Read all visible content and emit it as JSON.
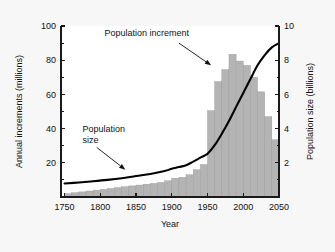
{
  "chart_data": {
    "type": "bar",
    "title": "",
    "xlabel": "Year",
    "ylabel": "Annual increments (millions)",
    "y2label": "Population size (billions)",
    "xlim": [
      1745,
      2050
    ],
    "ylim": [
      0,
      100
    ],
    "y2lim": [
      0,
      10
    ],
    "grid": false,
    "legend_position": "none",
    "x_ticks": [
      1750,
      1800,
      1850,
      1900,
      1950,
      2000,
      2050
    ],
    "x_tick_labels": [
      "1750",
      "1800",
      "1850",
      "1900",
      "1950",
      "2000",
      "2050"
    ],
    "y_ticks": [
      0,
      20,
      40,
      60,
      80,
      100
    ],
    "y_tick_labels": [
      "",
      "20",
      "40",
      "60",
      "80",
      "100"
    ],
    "y_minor_ticks": [
      10,
      30,
      50,
      70,
      90
    ],
    "y2_ticks": [
      2,
      4,
      6,
      8,
      10
    ],
    "y2_tick_labels": [
      "2",
      "4",
      "6",
      "8",
      "10"
    ],
    "y2_minor_ticks": [
      1,
      3,
      5,
      7,
      9
    ],
    "annotations": [
      {
        "name": "population-increment",
        "text": "Population increment",
        "text_x": 1865,
        "text_y": 94,
        "arrow_from_x": 1910,
        "arrow_from_y": 90,
        "arrow_to_x": 1955,
        "arrow_to_y": 77
      },
      {
        "name": "population-size",
        "text_line1": "Population",
        "text_line2": "size",
        "text_x": 1775,
        "text_y": 38,
        "arrow_from_x": 1795,
        "arrow_from_y": 29,
        "arrow_to_x": 1835,
        "arrow_to_y": 16
      }
    ],
    "series": [
      {
        "name": "Population increment",
        "type": "bar",
        "axis": "left",
        "unit": "millions per year",
        "bar_width_years": 10,
        "categories": [
          1750,
          1760,
          1770,
          1780,
          1790,
          1800,
          1810,
          1820,
          1830,
          1840,
          1850,
          1860,
          1870,
          1880,
          1890,
          1900,
          1910,
          1920,
          1930,
          1940,
          1950,
          1960,
          1970,
          1980,
          1990,
          2000,
          2010,
          2020,
          2030,
          2040
        ],
        "values": [
          2,
          2.5,
          3,
          3.5,
          4,
          4.5,
          5,
          5.5,
          6,
          6.5,
          7,
          7.5,
          8,
          8.5,
          9.5,
          11,
          11.5,
          13,
          16,
          19,
          50.5,
          67.5,
          74.5,
          83.5,
          79.5,
          77,
          70,
          61.5,
          47,
          33.5
        ]
      },
      {
        "name": "Population size",
        "type": "line",
        "axis": "right",
        "unit": "billions",
        "x": [
          1750,
          1770,
          1790,
          1810,
          1830,
          1850,
          1870,
          1890,
          1900,
          1910,
          1920,
          1930,
          1940,
          1950,
          1960,
          1970,
          1980,
          1990,
          2000,
          2010,
          2020,
          2030,
          2040,
          2050
        ],
        "values": [
          0.79,
          0.85,
          0.92,
          1.0,
          1.1,
          1.23,
          1.35,
          1.52,
          1.65,
          1.75,
          1.86,
          2.07,
          2.3,
          2.53,
          3.03,
          3.7,
          4.44,
          5.27,
          6.08,
          6.9,
          7.7,
          8.3,
          8.75,
          9.0
        ]
      }
    ]
  },
  "colors": {
    "bar_fill": "#b4b4b4",
    "bar_stroke": "#9a9a9a",
    "line": "#000000",
    "axis": "#1a1a1a",
    "plot_background": "#ffffff",
    "figure_background": "#f7f7f7",
    "text": "#111111"
  }
}
